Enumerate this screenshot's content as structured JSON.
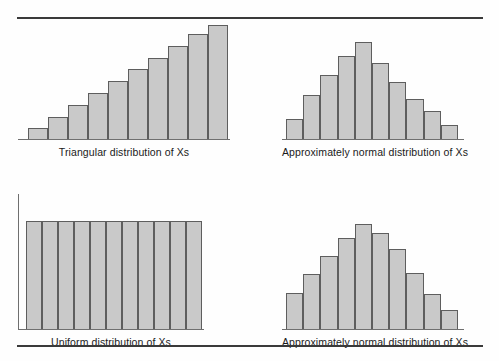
{
  "page": {
    "background_color": "#fefefe",
    "rule_color": "#3a3a3a",
    "bar_fill_color": "#c9c9c9",
    "bar_stroke_color": "#5e5e5e",
    "axis_color": "#6f6f6f",
    "text_color": "#1a1a1a"
  },
  "chart_data": [
    {
      "id": "triangular-distribution",
      "type": "bar",
      "title": "",
      "caption": "Triangular distribution of Xs",
      "xlabel": "",
      "ylabel": "",
      "categories": [
        "1",
        "2",
        "3",
        "4",
        "5",
        "6",
        "7",
        "8",
        "9",
        "10"
      ],
      "values": [
        9,
        19,
        29,
        39,
        49,
        59,
        69,
        79,
        89,
        97
      ],
      "ylim": [
        0,
        100
      ],
      "grid": false,
      "legend": "none",
      "bar_count": 10,
      "shape": "increasing-ramp"
    },
    {
      "id": "approx-normal-distribution-top",
      "type": "bar",
      "title": "",
      "caption": "Approximately normal distribution of Xs",
      "xlabel": "",
      "ylabel": "",
      "categories": [
        "1",
        "2",
        "3",
        "4",
        "5",
        "6",
        "7",
        "8",
        "9",
        "10"
      ],
      "values": [
        17,
        37,
        54,
        70,
        82,
        64,
        48,
        34,
        24,
        12
      ],
      "ylim": [
        0,
        100
      ],
      "grid": false,
      "legend": "none",
      "bar_count": 10,
      "shape": "bell"
    },
    {
      "id": "uniform-distribution",
      "type": "bar",
      "title": "",
      "caption": "Uniform distribution of Xs",
      "xlabel": "",
      "ylabel": "",
      "categories": [
        "1",
        "2",
        "3",
        "4",
        "5",
        "6",
        "7",
        "8",
        "9",
        "10",
        "11"
      ],
      "values": [
        92,
        92,
        92,
        92,
        92,
        92,
        92,
        92,
        92,
        92,
        92
      ],
      "ylim": [
        0,
        100
      ],
      "grid": false,
      "legend": "none",
      "bar_count": 11,
      "shape": "flat"
    },
    {
      "id": "approx-normal-distribution-bottom",
      "type": "bar",
      "title": "",
      "caption": "Approximately normal distribution of Xs",
      "xlabel": "",
      "ylabel": "",
      "categories": [
        "1",
        "2",
        "3",
        "4",
        "5",
        "6",
        "7",
        "8",
        "9",
        "10"
      ],
      "values": [
        31,
        47,
        62,
        78,
        90,
        82,
        68,
        48,
        30,
        16
      ],
      "ylim": [
        0,
        100
      ],
      "grid": false,
      "legend": "none",
      "bar_count": 10,
      "shape": "bell"
    }
  ],
  "captions": {
    "top_left": "Triangular distribution of Xs",
    "top_right": "Approximately normal distribution of Xs",
    "bottom_left": "Uniform distribution of Xs",
    "bottom_right": "Approximately normal distribution of Xs"
  }
}
